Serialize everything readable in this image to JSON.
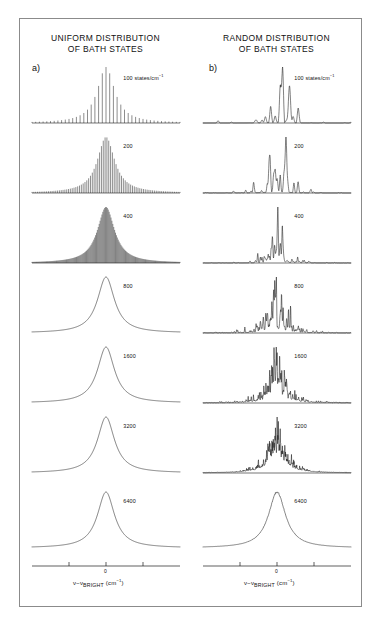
{
  "figure": {
    "columns": [
      {
        "key": "uniform",
        "panel_letter": "a)",
        "title_line1": "UNIFORM DISTRIBUTION",
        "title_line2": "OF BATH STATES",
        "distribution": "uniform",
        "axis": {
          "caption_main": "ν−ν",
          "caption_sub": "BRIGHT",
          "caption_unit": "(cm",
          "caption_unit_sup": "−1",
          "caption_unit_close": ")",
          "zero_tick_label": "0",
          "tick_count": 3
        },
        "panels": [
          {
            "density": "100",
            "units": "states/cm",
            "units_sup": "−1",
            "show_units": true
          },
          {
            "density": "200",
            "units": "",
            "units_sup": "",
            "show_units": false
          },
          {
            "density": "400",
            "units": "",
            "units_sup": "",
            "show_units": false
          },
          {
            "density": "800",
            "units": "",
            "units_sup": "",
            "show_units": false
          },
          {
            "density": "1600",
            "units": "",
            "units_sup": "",
            "show_units": false
          },
          {
            "density": "3200",
            "units": "",
            "units_sup": "",
            "show_units": false
          },
          {
            "density": "6400",
            "units": "",
            "units_sup": "",
            "show_units": false
          }
        ]
      },
      {
        "key": "random",
        "panel_letter": "b)",
        "title_line1": "RANDOM DISTRIBUTION",
        "title_line2": "OF BATH STATES",
        "distribution": "random",
        "axis": {
          "caption_main": "ν−ν",
          "caption_sub": "BRIGHT",
          "caption_unit": "(cm",
          "caption_unit_sup": "−1",
          "caption_unit_close": ")",
          "zero_tick_label": "0",
          "tick_count": 3
        },
        "panels": [
          {
            "density": "100",
            "units": "states/cm",
            "units_sup": "−1",
            "show_units": true
          },
          {
            "density": "200",
            "units": "",
            "units_sup": "",
            "show_units": false
          },
          {
            "density": "400",
            "units": "",
            "units_sup": "",
            "show_units": false
          },
          {
            "density": "800",
            "units": "",
            "units_sup": "",
            "show_units": false
          },
          {
            "density": "1600",
            "units": "",
            "units_sup": "",
            "show_units": false
          },
          {
            "density": "3200",
            "units": "",
            "units_sup": "",
            "show_units": false
          },
          {
            "density": "6400",
            "units": "",
            "units_sup": "",
            "show_units": false
          }
        ]
      }
    ],
    "colors": {
      "trace": "#1a1a1a",
      "frame": "#8b8b8b",
      "background": "#ffffff"
    }
  },
  "chart_data": {
    "type": "line",
    "xlabel": "ν−ν_BRIGHT (cm⁻¹)",
    "ylabel": "",
    "xlim": [
      -50,
      50
    ],
    "xticks": [
      -25,
      0,
      25
    ],
    "xticklabels": [
      "",
      "0",
      ""
    ],
    "grid": false,
    "legend": false,
    "panel_densities": [
      100,
      200,
      400,
      800,
      1600,
      3200,
      6400
    ],
    "density_units": "states/cm⁻¹",
    "envelope": {
      "shape": "lorentzian",
      "center": 0,
      "hwhm_cm1": 7.0,
      "description": "All panels share a common Lorentzian envelope; increasing bath state density fills the envelope with progressively denser transitions."
    },
    "series": [
      {
        "name": "uniform 100",
        "column": "a",
        "line_count": 41,
        "spacing_regular": true,
        "description": "Evenly spaced comb of 41 lines, intensities following a Lorentzian envelope; individual lines fully resolved."
      },
      {
        "name": "uniform 200",
        "column": "a",
        "line_count": 81,
        "spacing_regular": true,
        "description": "Evenly spaced comb of 81 lines under the same Lorentzian envelope; lines still resolved but beginning to crowd."
      },
      {
        "name": "uniform 400",
        "column": "a",
        "line_count": 161,
        "spacing_regular": true,
        "description": "Comb becomes nearly continuous; only the top of the envelope shows residual structure."
      },
      {
        "name": "uniform 800",
        "column": "a",
        "line_count": 321,
        "spacing_regular": true,
        "description": "Spectrum is a smooth Lorentzian; individual lines unresolved."
      },
      {
        "name": "uniform 1600",
        "column": "a",
        "line_count": 641,
        "spacing_regular": true,
        "description": "Smooth Lorentzian profile."
      },
      {
        "name": "uniform 3200",
        "column": "a",
        "line_count": 1281,
        "spacing_regular": true,
        "description": "Smooth Lorentzian profile."
      },
      {
        "name": "uniform 6400",
        "column": "a",
        "line_count": 2561,
        "spacing_regular": true,
        "description": "Smooth Lorentzian profile, indistinguishable from the limiting lineshape."
      },
      {
        "name": "random 100",
        "column": "b",
        "line_count": 41,
        "spacing_regular": false,
        "description": "Randomly positioned lines with strongly fluctuating intensities; a few dominant spikes near line center."
      },
      {
        "name": "random 200",
        "column": "b",
        "line_count": 81,
        "spacing_regular": false,
        "description": "Irregular clumps of lines; intensity fluctuations remain large."
      },
      {
        "name": "random 400",
        "column": "b",
        "line_count": 161,
        "spacing_regular": false,
        "description": "Dense irregular forest of lines tracing the Lorentzian envelope."
      },
      {
        "name": "random 800",
        "column": "b",
        "line_count": 321,
        "spacing_regular": false,
        "description": "Fluctuating quasi-continuum; envelope becoming apparent."
      },
      {
        "name": "random 1600",
        "column": "b",
        "line_count": 641,
        "spacing_regular": false,
        "description": "Noisy Lorentzian; fluctuation amplitude decreasing."
      },
      {
        "name": "random 3200",
        "column": "b",
        "line_count": 1281,
        "spacing_regular": false,
        "description": "Lorentzian with small residual noise on the profile."
      },
      {
        "name": "random 6400",
        "column": "b",
        "line_count": 2561,
        "spacing_regular": false,
        "description": "Nearly smooth Lorentzian with faint residual fluctuations near the peak."
      }
    ]
  }
}
